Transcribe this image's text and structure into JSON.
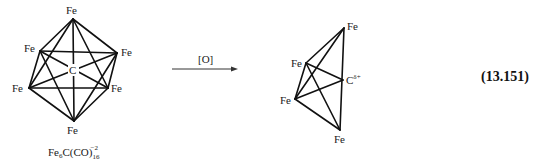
{
  "reactant": {
    "atoms": {
      "fe_top": "Fe",
      "fe_upper_left": "Fe",
      "fe_upper_right": "Fe",
      "fe_lower_left": "Fe",
      "fe_lower_right": "Fe",
      "fe_bottom": "Fe",
      "center": "C"
    },
    "formula": {
      "base": "Fe",
      "sub1": "6",
      "mid": "C(CO)",
      "sub2": "16",
      "charge": "−2"
    }
  },
  "arrow": {
    "reagent": "[O]"
  },
  "product": {
    "atoms": {
      "fe_top": "Fe",
      "fe_upper_left": "Fe",
      "fe_left": "Fe",
      "fe_bottom": "Fe",
      "carbon": "C",
      "carbon_charge": "δ+"
    }
  },
  "equation_number": "(13.151)"
}
